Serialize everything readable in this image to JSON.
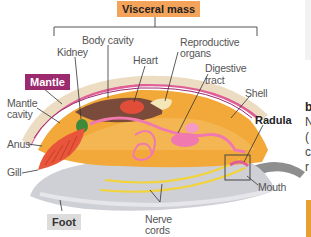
{
  "diagram": {
    "title_box": "Visceral mass",
    "boxed_labels": {
      "mantle": "Mantle",
      "foot": "Foot",
      "radula": "Radula"
    },
    "labels": {
      "body_cavity": "Body cavity",
      "kidney": "Kidney",
      "heart": "Heart",
      "reproductive_line1": "Reproductive",
      "reproductive_line2": "organs",
      "digestive_line1": "Digestive",
      "digestive_line2": "tract",
      "shell": "Shell",
      "mantle_cavity_line1": "Mantle",
      "mantle_cavity_line2": "cavity",
      "anus": "Anus",
      "gill": "Gill",
      "nerve_line1": "Nerve",
      "nerve_line2": "cords",
      "mouth": "Mouth"
    },
    "colors": {
      "visceral_box": "#f4a35a",
      "mantle_box": "#9c2a6f",
      "foot_box": "#dcdcdc",
      "shell": "#ecdcc2",
      "body": "#f2a93a",
      "foot": "#cfcfd4",
      "gill": "#e8553a",
      "digestive": "#f07ab0"
    }
  },
  "side_fragment": {
    "heading_char": "b",
    "lines": [
      "N",
      "(",
      "c",
      "r"
    ]
  }
}
